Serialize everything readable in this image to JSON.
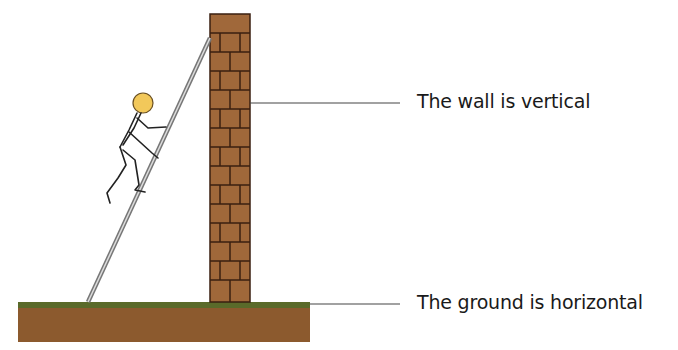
{
  "labels": {
    "wall": "The wall is vertical",
    "ground": "The ground is horizontal"
  },
  "colors": {
    "brick": "#a0683a",
    "mortar": "#3a1f10",
    "ground_soil": "#8c5a2e",
    "ground_grass": "#5a6a2a",
    "head": "#f2c85a",
    "ladder": "#8a8a8a",
    "leader_line": "#444444"
  },
  "components": [
    "wall",
    "ground",
    "ladder",
    "stick-figure"
  ]
}
